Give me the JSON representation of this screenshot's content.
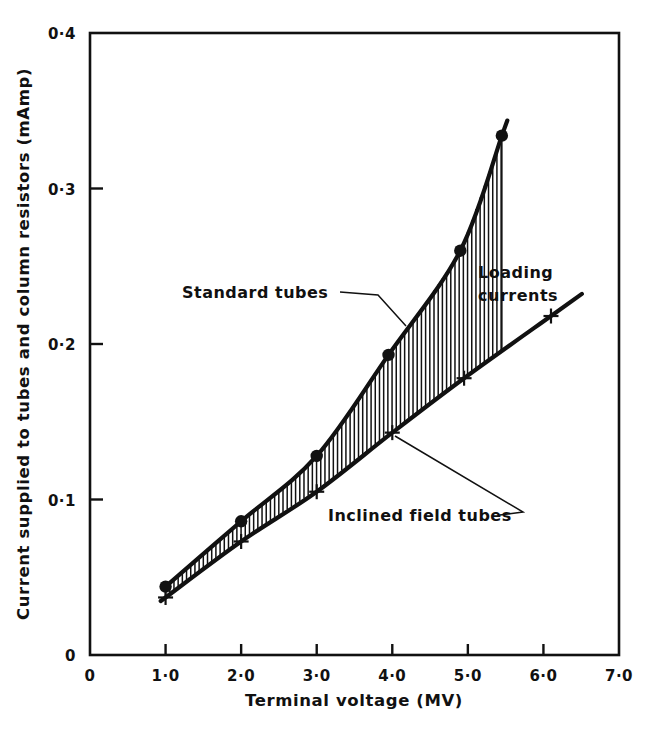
{
  "chart_data": {
    "type": "line",
    "title": "",
    "xlabel": "Terminal voltage (MV)",
    "ylabel": "Current supplied to tubes and column resistors (mAmp)",
    "xlim": [
      0,
      7.0
    ],
    "ylim": [
      0,
      0.4
    ],
    "grid": false,
    "x_ticks": [
      "0",
      "1·0",
      "2·0",
      "3·0",
      "4·0",
      "5·0",
      "6·0",
      "7·0"
    ],
    "x_tick_values": [
      0,
      1.0,
      2.0,
      3.0,
      4.0,
      5.0,
      6.0,
      7.0
    ],
    "y_ticks": [
      "0",
      "0·1",
      "0·2",
      "0·3",
      "0·4"
    ],
    "y_tick_values": [
      0,
      0.1,
      0.2,
      0.3,
      0.4
    ],
    "legend_position": "inline-annotations",
    "series": [
      {
        "name": "Standard tubes",
        "marker": "filled-circle",
        "x": [
          1.0,
          2.0,
          3.0,
          3.95,
          4.9,
          5.45
        ],
        "y": [
          0.044,
          0.086,
          0.128,
          0.193,
          0.26,
          0.334
        ]
      },
      {
        "name": "Inclined field tubes",
        "marker": "plus",
        "x": [
          1.0,
          2.0,
          3.0,
          4.0,
          4.95,
          6.1
        ],
        "y": [
          0.037,
          0.073,
          0.105,
          0.143,
          0.178,
          0.218
        ]
      }
    ],
    "annotations": [
      {
        "name": "standard-tubes-label",
        "text": "Standard tubes",
        "x": 2.2,
        "y": 0.235
      },
      {
        "name": "inclined-field-tubes-label",
        "text": "Inclined field tubes",
        "x": 3.3,
        "y": 0.108
      },
      {
        "name": "loading-currents-label-line1",
        "text": "Loading",
        "x": 5.05,
        "y": 0.252
      },
      {
        "name": "loading-currents-label-line2",
        "text": "currents",
        "x": 5.05,
        "y": 0.232
      }
    ],
    "shaded_region": {
      "name": "Loading currents",
      "pattern": "vertical-hatch",
      "between": [
        "Standard tubes",
        "Inclined field tubes"
      ]
    }
  },
  "axes": {
    "x_title": "Terminal voltage (MV)",
    "y_title": "Current supplied to tubes and column resistors (mAmp)",
    "x_tick_labels": [
      "0",
      "1·0",
      "2·0",
      "3·0",
      "4·0",
      "5·0",
      "6·0",
      "7·0"
    ],
    "y_tick_labels": [
      "0·4",
      "0·3",
      "0·2",
      "0·1",
      "0"
    ]
  },
  "labels": {
    "standard_tubes": "Standard tubes",
    "inclined_field_tubes": "Inclined field tubes",
    "loading_currents_line1": "Loading",
    "loading_currents_line2": "currents"
  },
  "colors": {
    "ink": "#111111",
    "background": "#ffffff"
  }
}
